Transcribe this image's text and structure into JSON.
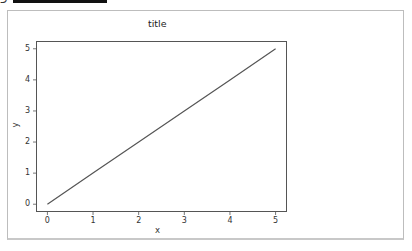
{
  "chart_data": {
    "type": "line",
    "title": "title",
    "xlabel": "x",
    "ylabel": "y",
    "x": [
      0,
      1,
      2,
      3,
      4,
      5
    ],
    "series": [
      {
        "name": "line",
        "values": [
          0,
          1,
          2,
          3,
          4,
          5
        ],
        "color": "#555555"
      }
    ],
    "xticks": [
      "0",
      "1",
      "2",
      "3",
      "4",
      "5"
    ],
    "yticks": [
      "0",
      "1",
      "2",
      "3",
      "4",
      "5"
    ],
    "xlim": [
      -0.25,
      5.25
    ],
    "ylim": [
      -0.25,
      5.25
    ],
    "grid": false,
    "legend": null
  }
}
